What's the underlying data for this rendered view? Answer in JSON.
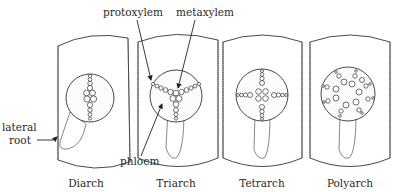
{
  "figure": {
    "panels": [
      {
        "name": "diarch",
        "label": "Diarch",
        "xylem_arms": 2
      },
      {
        "name": "triarch",
        "label": "Triarch",
        "xylem_arms": 3
      },
      {
        "name": "tetrarch",
        "label": "Tetrarch",
        "xylem_arms": 4
      },
      {
        "name": "polyarch",
        "label": "Polyarch",
        "xylem_arms": "many"
      }
    ],
    "annotations": {
      "protoxylem": "protoxylem",
      "metaxylem": "metaxylem",
      "phloem": "phloem",
      "lateral_root_line1": "lateral",
      "lateral_root_line2": "root"
    },
    "colors": {
      "line": "#333333",
      "background": "#ffffff",
      "text": "#2a2a2a"
    }
  }
}
